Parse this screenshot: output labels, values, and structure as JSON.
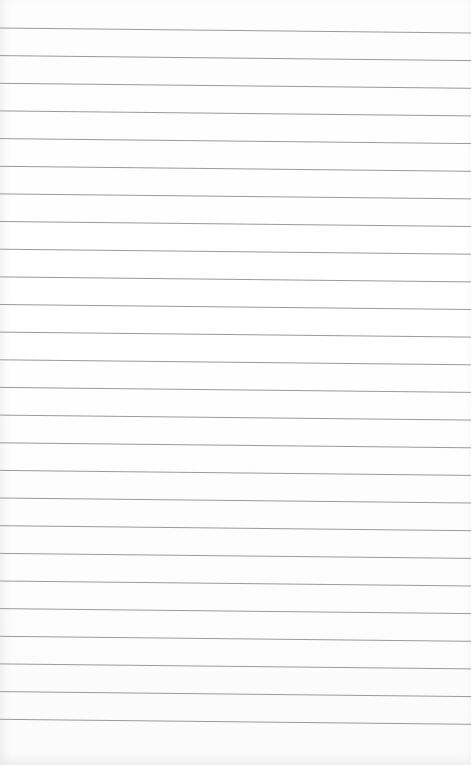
{
  "paper": {
    "type": "lined-paper",
    "line_count": 26,
    "first_line_y": 28,
    "line_spacing": 27.65,
    "line_slope_px": 5,
    "line_color": "#9a9a9a",
    "background_color": "#ffffff"
  }
}
